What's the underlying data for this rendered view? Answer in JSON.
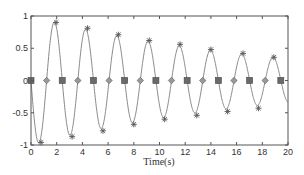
{
  "chart_data": {
    "type": "line",
    "title": "",
    "xlabel": "Time(s)",
    "ylabel": "",
    "xlim": [
      0,
      20
    ],
    "ylim": [
      -1,
      1
    ],
    "grid": false,
    "legend": null,
    "xticks": [
      "0",
      "2",
      "4",
      "6",
      "8",
      "10",
      "12",
      "14",
      "16",
      "18",
      "20"
    ],
    "yticks": [
      "1",
      "0.5",
      "0",
      "-0.5",
      "-1"
    ],
    "series": [
      {
        "name": "damped oscillation",
        "style": "solid gray line",
        "model": "y = -exp(-0.054 t) * sin(2.585 t)",
        "peaks": {
          "marker": "star",
          "t": [
            1.95,
            4.4,
            6.8,
            9.2,
            11.6,
            14.0,
            16.5,
            18.9
          ],
          "y": [
            0.9,
            0.81,
            0.71,
            0.62,
            0.56,
            0.48,
            0.42,
            0.36
          ]
        },
        "troughs": {
          "marker": "star",
          "t": [
            0.78,
            3.2,
            5.6,
            8.0,
            10.4,
            12.9,
            15.3,
            17.7
          ],
          "y": [
            -0.96,
            -0.87,
            -0.78,
            -0.68,
            -0.6,
            -0.54,
            -0.48,
            -0.43
          ]
        },
        "zero_crossings_down": {
          "marker": "square",
          "t": [
            0.0,
            2.43,
            4.86,
            7.29,
            9.72,
            12.15,
            14.58,
            17.01,
            19.44
          ],
          "y": [
            0,
            0,
            0,
            0,
            0,
            0,
            0,
            0,
            0
          ]
        },
        "zero_crossings_up": {
          "marker": "diamond",
          "t": [
            1.215,
            3.645,
            6.075,
            8.505,
            10.935,
            13.365,
            15.795,
            18.225
          ],
          "y": [
            0,
            0,
            0,
            0,
            0,
            0,
            0,
            0
          ]
        }
      }
    ]
  },
  "colors": {
    "line": "#8a8a8a",
    "axis": "#555555",
    "marker": "#555555"
  }
}
